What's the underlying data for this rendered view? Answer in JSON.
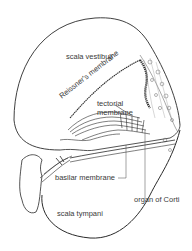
{
  "diagram": {
    "type": "cross-section",
    "labels": {
      "scala_vestibuli": "scala vestibuli",
      "reissners_membrane": "Reissner's membrane",
      "tectorial_membrane_line1": "tectorial",
      "tectorial_membrane_line2": "membrane",
      "basilar_membrane": "basilar membrane",
      "organ_of_corti": "organ of Corti",
      "scala_tympani": "scala tympani"
    },
    "colors": {
      "line": "#2a2a2a",
      "text": "#3a3a3a",
      "background": "#ffffff"
    }
  }
}
